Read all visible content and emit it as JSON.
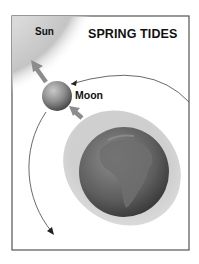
{
  "diagram": {
    "title": "SPRING TIDES",
    "labels": {
      "sun": "Sun",
      "moon": "Moon"
    },
    "bodies": [
      {
        "name": "Sun",
        "position": "top-left corner",
        "shade": "#c8c8c8"
      },
      {
        "name": "Moon",
        "position": "between Sun and Earth",
        "shade": "#8a8a8a"
      },
      {
        "name": "Earth",
        "position": "lower-right",
        "shade": "#5a5a5a",
        "feature": "Africa visible"
      }
    ],
    "tidal_bulge": {
      "shape": "ellipse",
      "orientation": "elongated toward Moon and Sun",
      "shade": "#cfcfcf"
    },
    "arrows": [
      {
        "from": "Moon",
        "direction": "toward Sun",
        "meaning": "gravitational pull"
      },
      {
        "from": "Earth",
        "direction": "toward Moon",
        "meaning": "gravitational pull"
      }
    ],
    "orbit": {
      "description": "Moon's orbit arc around Earth",
      "direction": "counter-clockwise arrows"
    },
    "colors": {
      "frame": "#555555",
      "arrow": "#8c8c8c",
      "orbit_line": "#444444"
    }
  }
}
